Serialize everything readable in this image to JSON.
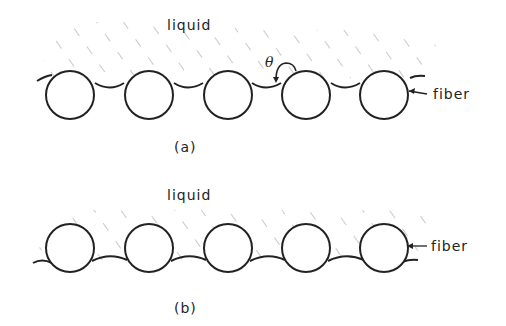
{
  "diagram": {
    "panel_a": {
      "liquid_label": "liquid",
      "fiber_label": "fiber",
      "angle_label": "θ",
      "caption": "(a)"
    },
    "panel_b": {
      "liquid_label": "liquid",
      "fiber_label": "fiber",
      "caption": "(b)"
    },
    "colors": {
      "line": "#222222",
      "hatch": "#9a9a9a",
      "background": "#ffffff"
    }
  }
}
